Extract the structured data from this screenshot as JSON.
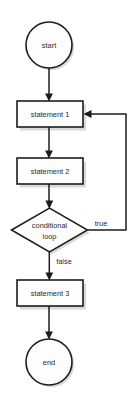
{
  "diagram": {
    "type": "flowchart",
    "background_color": "#ffffff",
    "stroke_color": "#1c1c1c",
    "fill_color": "#fdfdfd",
    "text_color": "#2a2a2a",
    "nodes": [
      {
        "id": "start",
        "shape": "circle",
        "label": "start",
        "cx": 49,
        "cy": 45,
        "r": 23
      },
      {
        "id": "statement-1",
        "shape": "rectangle",
        "label": "statement 1",
        "x": 17,
        "y": 101,
        "width": 66,
        "height": 26
      },
      {
        "id": "statement-2",
        "shape": "rectangle",
        "label": "statement 2",
        "x": 17,
        "y": 158,
        "width": 66,
        "height": 26
      },
      {
        "id": "conditional-loop",
        "shape": "diamond",
        "label_line_1": "conditional",
        "label_line_2": "loop",
        "cx": 49.5,
        "cy": 230,
        "half_width": 38,
        "half_height": 22
      },
      {
        "id": "statement-3",
        "shape": "rectangle",
        "label": "statement 3",
        "x": 17,
        "y": 280,
        "width": 66,
        "height": 26
      },
      {
        "id": "end",
        "shape": "circle",
        "label": "end",
        "cx": 49,
        "cy": 362,
        "r": 23
      }
    ],
    "edges": [
      {
        "id": "start-to-statement-1",
        "from": "start",
        "to": "statement-1",
        "label": "",
        "direction": "down"
      },
      {
        "id": "statement-1-to-statement-2",
        "from": "statement-1",
        "to": "statement-2",
        "label": "",
        "direction": "down"
      },
      {
        "id": "statement-2-to-conditional-loop",
        "from": "statement-2",
        "to": "conditional-loop",
        "label": "",
        "direction": "down"
      },
      {
        "id": "conditional-loop-true-to-statement-1",
        "from": "conditional-loop",
        "to": "statement-1",
        "label": "true",
        "label_x": 101,
        "label_y": 224,
        "direction": "right-up-left"
      },
      {
        "id": "conditional-loop-false-to-statement-3",
        "from": "conditional-loop",
        "to": "statement-3",
        "label": "false",
        "label_x": 64,
        "label_y": 262,
        "direction": "down"
      },
      {
        "id": "statement-3-to-end",
        "from": "statement-3",
        "to": "end",
        "label": "",
        "direction": "down"
      }
    ]
  }
}
